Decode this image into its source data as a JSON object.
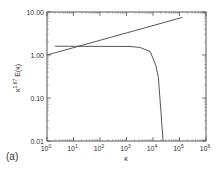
{
  "chart_data": {
    "type": "line",
    "title": "",
    "panel_label": "(a)",
    "xlabel": "κ",
    "ylabel": "κ^1.67 E(κ)",
    "ylabel_base": "κ",
    "ylabel_exp": "1.67",
    "ylabel_rest": "E(κ)",
    "x_scale": "log",
    "y_scale": "log",
    "xlim": [
      1,
      1000000
    ],
    "ylim": [
      0.01,
      10
    ],
    "x_ticks": [
      {
        "base": "10",
        "exp": "0"
      },
      {
        "base": "10",
        "exp": "1"
      },
      {
        "base": "10",
        "exp": "2"
      },
      {
        "base": "10",
        "exp": "3"
      },
      {
        "base": "10",
        "exp": "4"
      },
      {
        "base": "10",
        "exp": "5"
      },
      {
        "base": "10",
        "exp": "6"
      }
    ],
    "y_ticks": [
      "10.00",
      "1.00",
      "0.10",
      "0.01"
    ],
    "grid": false,
    "legend": null,
    "series": [
      {
        "name": "reference slope line",
        "x": [
          1,
          130000
        ],
        "y": [
          1.0,
          7.5
        ]
      },
      {
        "name": "compensated spectrum",
        "x": [
          2,
          1350,
          3200,
          7900,
          13000,
          16000,
          24000
        ],
        "y": [
          1.6,
          1.58,
          1.5,
          1.2,
          0.55,
          0.3,
          0.01
        ]
      }
    ]
  }
}
